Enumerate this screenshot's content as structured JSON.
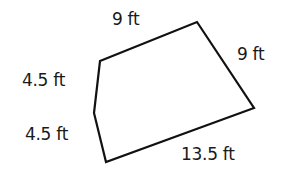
{
  "diagram": {
    "shape": "pentagon",
    "stroke_color": "#111111",
    "vertices": [
      [
        100,
        61
      ],
      [
        197,
        22
      ],
      [
        254,
        108
      ],
      [
        106,
        162
      ],
      [
        94,
        113
      ]
    ],
    "labels": {
      "top": "9 ft",
      "right": "9 ft",
      "bottom": "13.5 ft",
      "left_lower": "4.5 ft",
      "left_upper": "4.5 ft"
    }
  }
}
